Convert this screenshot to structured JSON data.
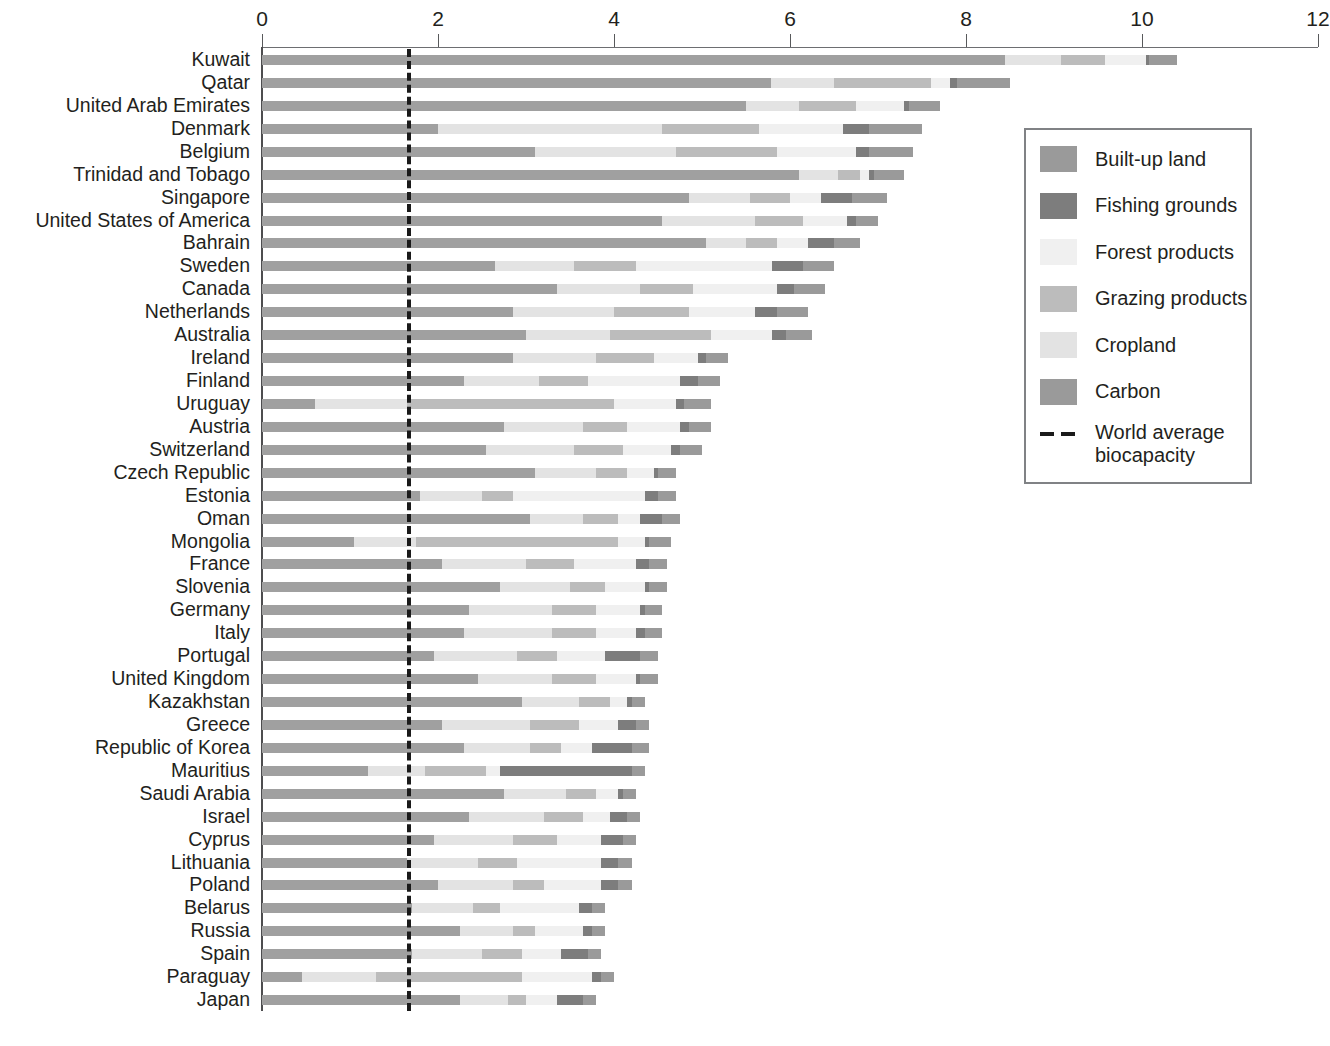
{
  "chart_data": {
    "type": "bar",
    "orientation": "horizontal",
    "stacked": true,
    "title": "",
    "xlabel": "",
    "ylabel": "",
    "xlim": [
      0,
      12
    ],
    "xticks": [
      0,
      2,
      4,
      6,
      8,
      10,
      12
    ],
    "xtick_labels": [
      "0",
      "2",
      "4",
      "6",
      "8",
      "10",
      "12"
    ],
    "grid": false,
    "legend_position": "right",
    "series": [
      {
        "name": "Carbon",
        "color": "#a0a0a0"
      },
      {
        "name": "Cropland",
        "color": "#e3e3e3"
      },
      {
        "name": "Grazing products",
        "color": "#bcbcbc"
      },
      {
        "name": "Forest products",
        "color": "#f0f0f0"
      },
      {
        "name": "Fishing grounds",
        "color": "#7d7d7d"
      },
      {
        "name": "Built-up land",
        "color": "#9a9a9a"
      }
    ],
    "reference_line": {
      "label": "World average biocapacity",
      "value": 1.67,
      "style": "dashed",
      "color": "#1a1a1a"
    },
    "categories": [
      "Kuwait",
      "Qatar",
      "United Arab Emirates",
      "Denmark",
      "Belgium",
      "Trinidad and Tobago",
      "Singapore",
      "United States of America",
      "Bahrain",
      "Sweden",
      "Canada",
      "Netherlands",
      "Australia",
      "Ireland",
      "Finland",
      "Uruguay",
      "Austria",
      "Switzerland",
      "Czech Republic",
      "Estonia",
      "Oman",
      "Mongolia",
      "France",
      "Slovenia",
      "Germany",
      "Italy",
      "Portugal",
      "United Kingdom",
      "Kazakhstan",
      "Greece",
      "Republic of Korea",
      "Mauritius",
      "Saudi Arabia",
      "Israel",
      "Cyprus",
      "Lithuania",
      "Poland",
      "Belarus",
      "Russia",
      "Spain",
      "Paraguay",
      "Japan"
    ],
    "totals": [
      10.4,
      8.5,
      7.7,
      7.5,
      7.4,
      7.3,
      7.1,
      7.0,
      6.8,
      6.5,
      6.4,
      6.2,
      6.25,
      5.3,
      5.2,
      5.1,
      5.1,
      5.0,
      4.7,
      4.7,
      4.75,
      4.65,
      4.6,
      4.6,
      4.55,
      4.55,
      4.5,
      4.5,
      4.35,
      4.4,
      4.4,
      4.35,
      4.25,
      4.3,
      4.25,
      4.2,
      4.2,
      3.9,
      3.9,
      3.85,
      4.0,
      3.8
    ],
    "values": [
      [
        8.44,
        0.64,
        0.5,
        0.46,
        0.04,
        0.32
      ],
      [
        5.78,
        0.72,
        1.1,
        0.22,
        0.08,
        0.6
      ],
      [
        5.5,
        0.6,
        0.65,
        0.55,
        0.05,
        0.35
      ],
      [
        2.0,
        2.55,
        1.1,
        0.95,
        0.3,
        0.6
      ],
      [
        3.1,
        1.6,
        1.15,
        0.9,
        0.15,
        0.5
      ],
      [
        6.1,
        0.45,
        0.25,
        0.1,
        0.05,
        0.35
      ],
      [
        4.85,
        0.7,
        0.45,
        0.35,
        0.35,
        0.4
      ],
      [
        4.55,
        1.05,
        0.55,
        0.5,
        0.1,
        0.25
      ],
      [
        5.05,
        0.45,
        0.35,
        0.35,
        0.3,
        0.3
      ],
      [
        2.65,
        0.9,
        0.7,
        1.55,
        0.35,
        0.35
      ],
      [
        3.35,
        0.95,
        0.6,
        0.95,
        0.2,
        0.35
      ],
      [
        2.85,
        1.15,
        0.85,
        0.75,
        0.25,
        0.35
      ],
      [
        3.0,
        0.95,
        1.15,
        0.7,
        0.15,
        0.3
      ],
      [
        2.85,
        0.95,
        0.65,
        0.5,
        0.1,
        0.25
      ],
      [
        2.3,
        0.85,
        0.55,
        1.05,
        0.2,
        0.25
      ],
      [
        0.6,
        1.05,
        2.35,
        0.7,
        0.1,
        0.3
      ],
      [
        2.75,
        0.9,
        0.5,
        0.6,
        0.1,
        0.25
      ],
      [
        2.55,
        1.0,
        0.55,
        0.55,
        0.1,
        0.25
      ],
      [
        3.1,
        0.7,
        0.35,
        0.3,
        0.05,
        0.2
      ],
      [
        1.8,
        0.7,
        0.35,
        1.5,
        0.15,
        0.2
      ],
      [
        3.05,
        0.6,
        0.4,
        0.25,
        0.25,
        0.2
      ],
      [
        1.05,
        0.7,
        2.3,
        0.3,
        0.05,
        0.25
      ],
      [
        2.05,
        0.95,
        0.55,
        0.7,
        0.15,
        0.2
      ],
      [
        2.7,
        0.8,
        0.4,
        0.45,
        0.05,
        0.2
      ],
      [
        2.35,
        0.95,
        0.5,
        0.5,
        0.05,
        0.2
      ],
      [
        2.3,
        1.0,
        0.5,
        0.45,
        0.1,
        0.2
      ],
      [
        1.95,
        0.95,
        0.45,
        0.55,
        0.4,
        0.2
      ],
      [
        2.45,
        0.85,
        0.5,
        0.45,
        0.05,
        0.2
      ],
      [
        2.95,
        0.65,
        0.35,
        0.2,
        0.05,
        0.15
      ],
      [
        2.05,
        1.0,
        0.55,
        0.45,
        0.2,
        0.15
      ],
      [
        2.3,
        0.75,
        0.35,
        0.35,
        0.45,
        0.2
      ],
      [
        1.2,
        0.65,
        0.7,
        0.15,
        1.5,
        0.15
      ],
      [
        2.75,
        0.7,
        0.35,
        0.25,
        0.05,
        0.15
      ],
      [
        2.35,
        0.85,
        0.45,
        0.3,
        0.2,
        0.15
      ],
      [
        1.95,
        0.9,
        0.5,
        0.5,
        0.25,
        0.15
      ],
      [
        1.65,
        0.8,
        0.45,
        0.95,
        0.2,
        0.15
      ],
      [
        2.0,
        0.85,
        0.35,
        0.65,
        0.2,
        0.15
      ],
      [
        1.7,
        0.7,
        0.3,
        0.9,
        0.15,
        0.15
      ],
      [
        2.25,
        0.6,
        0.25,
        0.55,
        0.1,
        0.15
      ],
      [
        1.7,
        0.8,
        0.45,
        0.45,
        0.3,
        0.15
      ],
      [
        0.45,
        0.85,
        1.65,
        0.8,
        0.1,
        0.15
      ],
      [
        2.25,
        0.55,
        0.2,
        0.35,
        0.3,
        0.15
      ]
    ]
  },
  "axis": {
    "ticks": [
      "0",
      "2",
      "4",
      "6",
      "8",
      "10",
      "12"
    ]
  },
  "legend": {
    "items": [
      {
        "label": "Built-up land",
        "color": "#9a9a9a"
      },
      {
        "label": "Fishing grounds",
        "color": "#7d7d7d"
      },
      {
        "label": "Forest products",
        "color": "#f0f0f0"
      },
      {
        "label": "Grazing products",
        "color": "#bcbcbc"
      },
      {
        "label": "Cropland",
        "color": "#e3e3e3"
      },
      {
        "label": "Carbon",
        "color": "#9a9a9a"
      }
    ],
    "reference": {
      "label": "World average\nbiocapacity"
    }
  }
}
